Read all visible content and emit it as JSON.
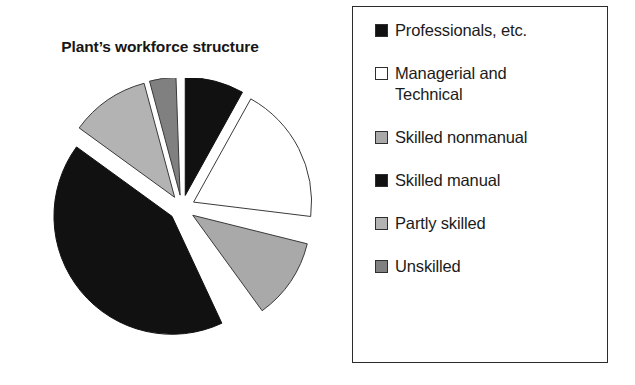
{
  "chart": {
    "title": "Plant’s workforce structure"
  },
  "legend": {
    "name": "legend-box",
    "items": [
      {
        "label": "Professionals, etc.",
        "swatch": "black-swatch",
        "color": "#111111",
        "border": "#2e2e2e"
      },
      {
        "label": "Managerial and\nTechnical",
        "swatch": "white-swatch",
        "color": "#ffffff",
        "border": "#2e2e2e"
      },
      {
        "label": "Skilled nonmanual",
        "swatch": "light-gray-swatch",
        "color": "#a9a9a9",
        "border": "#2e2e2e"
      },
      {
        "label": "Skilled manual",
        "swatch": "black-swatch",
        "color": "#111111",
        "border": "#2e2e2e"
      },
      {
        "label": "Partly skilled",
        "swatch": "light-gray-swatch",
        "color": "#b3b3b3",
        "border": "#2e2e2e"
      },
      {
        "label": "Unskilled",
        "swatch": "medium-gray-swatch",
        "color": "#808080",
        "border": "#2e2e2e"
      }
    ]
  },
  "chart_data": {
    "type": "pie",
    "title": "Plant’s workforce structure",
    "xlabel": "",
    "ylabel": "",
    "exploded": true,
    "legend_position": "right",
    "grid": false,
    "categories": [
      "Professionals, etc.",
      "Managerial and Technical",
      "Skilled nonmanual",
      "Skilled manual",
      "Partly skilled",
      "Unskilled"
    ],
    "values": [
      8,
      19,
      11,
      42,
      11,
      5
    ],
    "units": "percent",
    "colors": [
      "#111111",
      "#ffffff",
      "#a9a9a9",
      "#111111",
      "#b3b3b3",
      "#808080"
    ],
    "slices": [
      {
        "label": "Professionals, etc.",
        "value": 8,
        "start_angle": 0,
        "end_angle": 29,
        "color": "#111111",
        "stroke": "#111111"
      },
      {
        "label": "Managerial and Technical",
        "value": 19,
        "start_angle": 29,
        "end_angle": 97,
        "color": "#ffffff",
        "stroke": "#3a3a3a"
      },
      {
        "label": "Skilled nonmanual",
        "value": 11,
        "start_angle": 104,
        "end_angle": 144,
        "color": "#a9a9a9",
        "stroke": "#3a3a3a"
      },
      {
        "label": "Skilled manual",
        "value": 42,
        "start_angle": 155,
        "end_angle": 306,
        "color": "#111111",
        "stroke": "#111111"
      },
      {
        "label": "Partly skilled",
        "value": 11,
        "start_angle": 306,
        "end_angle": 345,
        "color": "#b3b3b3",
        "stroke": "#3a3a3a"
      },
      {
        "label": "Unskilled",
        "value": 5,
        "start_angle": 345,
        "end_angle": 358,
        "color": "#808080",
        "stroke": "#3a3a3a"
      }
    ]
  }
}
